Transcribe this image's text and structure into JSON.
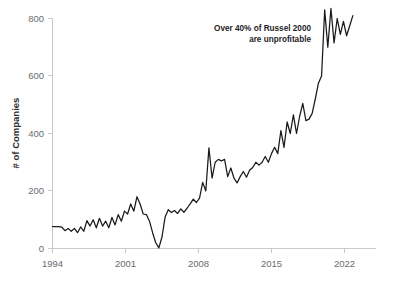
{
  "chart_data": {
    "type": "line",
    "title": "",
    "subtitle": "",
    "xlabel": "",
    "ylabel": "# of Companies",
    "xlim": [
      1994,
      2023
    ],
    "ylim": [
      0,
      840
    ],
    "grid": false,
    "legend": "none",
    "line_color": "#1a1a1c",
    "axis_color": "#c9c9cb",
    "text_color": "#6b6b6d",
    "xticks": [
      1994,
      2001,
      2008,
      2015,
      2022
    ],
    "xtick_labels": [
      "1994",
      "2001",
      "2008",
      "2015",
      "2022"
    ],
    "yticks": [
      0,
      200,
      400,
      600,
      800
    ],
    "ytick_labels": [
      "0",
      "200",
      "400",
      "600",
      "800"
    ],
    "annotations": [
      {
        "name": "russell-callout",
        "line1": "Over 40% of Russel 2000",
        "line2": "are unprofitable",
        "align": "right"
      }
    ],
    "series": [
      {
        "name": "Unprofitable companies in Russell 2000",
        "x": [
          1994.0,
          1994.3,
          1994.6,
          1994.9,
          1995.2,
          1995.5,
          1995.8,
          1996.1,
          1996.4,
          1996.7,
          1997.0,
          1997.3,
          1997.6,
          1997.9,
          1998.2,
          1998.5,
          1998.8,
          1999.1,
          1999.4,
          1999.7,
          2000.0,
          2000.3,
          2000.6,
          2000.9,
          2001.2,
          2001.5,
          2001.8,
          2002.1,
          2002.4,
          2002.7,
          2003.0,
          2003.3,
          2003.6,
          2003.9,
          2004.2,
          2004.5,
          2004.8,
          2005.1,
          2005.4,
          2005.7,
          2006.0,
          2006.3,
          2006.6,
          2006.9,
          2007.2,
          2007.5,
          2007.8,
          2008.1,
          2008.4,
          2008.7,
          2009.0,
          2009.3,
          2009.6,
          2009.9,
          2010.2,
          2010.5,
          2010.8,
          2011.1,
          2011.4,
          2011.7,
          2012.0,
          2012.3,
          2012.6,
          2012.9,
          2013.2,
          2013.5,
          2013.8,
          2014.1,
          2014.4,
          2014.7,
          2015.0,
          2015.3,
          2015.6,
          2015.9,
          2016.2,
          2016.5,
          2016.8,
          2017.1,
          2017.4,
          2017.7,
          2018.0,
          2018.3,
          2018.6,
          2018.9,
          2019.2,
          2019.5,
          2019.8,
          2020.1,
          2020.4,
          2020.7,
          2021.0,
          2021.3,
          2021.6,
          2021.9,
          2022.2,
          2022.5,
          2022.8
        ],
        "values": [
          76,
          76,
          76,
          74,
          62,
          70,
          60,
          70,
          55,
          75,
          60,
          97,
          78,
          100,
          72,
          105,
          78,
          95,
          72,
          108,
          82,
          118,
          95,
          130,
          120,
          155,
          130,
          180,
          155,
          120,
          118,
          95,
          55,
          20,
          2,
          40,
          110,
          135,
          125,
          132,
          122,
          138,
          126,
          140,
          155,
          172,
          160,
          175,
          230,
          200,
          350,
          245,
          300,
          310,
          305,
          310,
          250,
          280,
          245,
          228,
          250,
          268,
          248,
          272,
          282,
          300,
          290,
          300,
          320,
          300,
          330,
          352,
          330,
          410,
          352,
          440,
          400,
          465,
          400,
          460,
          505,
          445,
          450,
          470,
          520,
          575,
          600,
          830,
          700,
          835,
          715,
          800,
          745,
          790,
          740,
          775,
          810
        ]
      }
    ]
  },
  "axes": {
    "ylabel_text": "# of Companies"
  }
}
